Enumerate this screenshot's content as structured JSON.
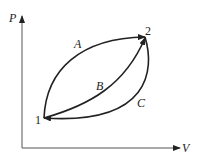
{
  "diagram": {
    "axes": {
      "y_label": "P",
      "x_label": "V"
    },
    "points": [
      {
        "label": "1"
      },
      {
        "label": "2"
      }
    ],
    "paths": [
      {
        "label": "A",
        "from": "1",
        "to": "2"
      },
      {
        "label": "B",
        "from": "1",
        "to": "2"
      },
      {
        "label": "C",
        "from": "2",
        "to": "1"
      }
    ],
    "colors": {
      "line": "#222222",
      "axis": "#555555"
    }
  }
}
